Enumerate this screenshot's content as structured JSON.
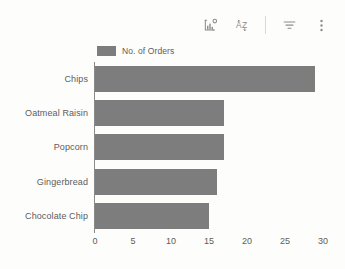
{
  "toolbar": {
    "buttons": [
      {
        "name": "chart-type-icon",
        "label": "Chart settings"
      },
      {
        "name": "sort-alpha-icon",
        "label": "A-Z sort"
      },
      {
        "name": "filter-icon",
        "label": "Filter"
      },
      {
        "name": "more-options-icon",
        "label": "More options"
      }
    ]
  },
  "legend": {
    "label": "No. of Orders",
    "swatch_color": "#7d7d7d",
    "position": "top-left"
  },
  "colors": {
    "bar": "#7d7d7d",
    "background": "#fdfdfc",
    "text": "#5c5c5c",
    "axis": "#8a8a8a"
  },
  "chart_data": {
    "type": "bar",
    "orientation": "horizontal",
    "title": "",
    "subtitle": "",
    "xlabel": "",
    "ylabel": "",
    "categories": [
      "Chips",
      "Oatmeal Raisin",
      "Popcorn",
      "Gingerbread",
      "Chocolate Chip"
    ],
    "values": [
      29,
      17,
      17,
      16,
      15
    ],
    "series": [
      {
        "name": "No. of Orders",
        "values": [
          29,
          17,
          17,
          16,
          15
        ]
      }
    ],
    "xlim": [
      0,
      30
    ],
    "xticks": [
      0,
      5,
      10,
      15,
      20,
      25,
      30
    ],
    "xticklabels": [
      "0",
      "5",
      "10",
      "15",
      "20",
      "25",
      "30"
    ],
    "grid": false,
    "legend": "top-left"
  }
}
